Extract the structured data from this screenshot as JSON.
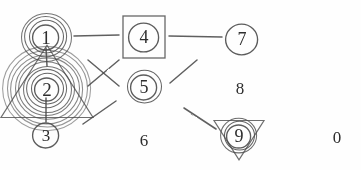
{
  "figure": {
    "background_color": "#fefefe",
    "ink_color": "#4a4a4a",
    "glyph_color": "#2e2e2e",
    "width": 361,
    "height": 170,
    "style": "pencil sketch"
  },
  "nodes": [
    {
      "id": "node-1",
      "label": "1",
      "x": 46,
      "y": 37,
      "font_size": 19,
      "decoration": "concentric-circles",
      "ring_count": 4,
      "ring_radii": [
        13,
        17,
        21,
        25
      ],
      "has_square": false,
      "has_triangle": false
    },
    {
      "id": "node-2",
      "label": "2",
      "x": 47,
      "y": 89,
      "font_size": 19,
      "decoration": "concentric-circles-with-triangle",
      "ring_count": 9,
      "ring_radii": [
        12,
        16,
        20,
        24,
        28,
        32,
        36,
        40,
        44
      ],
      "has_square": false,
      "has_triangle": true,
      "triangle_size": 46,
      "triangle_direction": "up"
    },
    {
      "id": "node-3",
      "label": "3",
      "x": 46,
      "y": 135,
      "font_size": 17,
      "decoration": "single-circle",
      "ring_count": 1,
      "ring_radii": [
        13
      ],
      "has_square": false,
      "has_triangle": false
    },
    {
      "id": "node-4",
      "label": "4",
      "x": 144,
      "y": 37,
      "font_size": 18,
      "decoration": "circle-in-square",
      "ring_count": 1,
      "ring_radii": [
        15
      ],
      "has_square": true,
      "square_size": 42,
      "has_triangle": false
    },
    {
      "id": "node-5",
      "label": "5",
      "x": 144,
      "y": 87,
      "font_size": 18,
      "decoration": "double-circle",
      "ring_count": 2,
      "ring_radii": [
        13,
        17
      ],
      "has_square": false,
      "has_triangle": false
    },
    {
      "id": "node-6",
      "label": "6",
      "x": 144,
      "y": 140,
      "font_size": 17,
      "decoration": "none",
      "ring_count": 0,
      "ring_radii": [],
      "has_square": false,
      "has_triangle": false
    },
    {
      "id": "node-7",
      "label": "7",
      "x": 242,
      "y": 39,
      "font_size": 18,
      "decoration": "single-circle",
      "ring_count": 1,
      "ring_radii": [
        16
      ],
      "has_square": false,
      "has_triangle": false
    },
    {
      "id": "node-8",
      "label": "8",
      "x": 240,
      "y": 88,
      "font_size": 17,
      "decoration": "none",
      "ring_count": 0,
      "ring_radii": [],
      "has_square": false,
      "has_triangle": false
    },
    {
      "id": "node-9",
      "label": "9",
      "x": 239,
      "y": 136,
      "font_size": 18,
      "decoration": "concentric-circles-with-triangle",
      "ring_count": 3,
      "ring_radii": [
        12,
        15,
        18
      ],
      "has_square": false,
      "has_triangle": true,
      "triangle_size": 25,
      "triangle_direction": "down"
    },
    {
      "id": "node-0",
      "label": "0",
      "x": 337,
      "y": 137,
      "font_size": 17,
      "decoration": "none",
      "ring_count": 0,
      "ring_radii": [],
      "has_square": false,
      "has_triangle": false
    }
  ],
  "edges": [
    {
      "id": "edge-1-4",
      "from": "node-1",
      "to": "node-4",
      "x1": 74,
      "y1": 36,
      "x2": 119,
      "y2": 35,
      "kind": "straight-horizontal"
    },
    {
      "id": "edge-4-7",
      "from": "node-4",
      "to": "node-7",
      "x1": 169,
      "y1": 36,
      "x2": 222,
      "y2": 37,
      "kind": "straight-horizontal"
    },
    {
      "id": "edge-1-2",
      "from": "node-1",
      "to": "node-2",
      "x1": 46,
      "y1": 48,
      "x2": 47,
      "y2": 66,
      "kind": "straight-vertical"
    },
    {
      "id": "edge-2-3",
      "from": "node-2",
      "to": "node-3",
      "x1": 46,
      "y1": 98,
      "x2": 46,
      "y2": 122,
      "kind": "straight-vertical"
    },
    {
      "id": "edge-cross-a",
      "from": "cross",
      "to": "cross",
      "x1": 88,
      "y1": 60,
      "x2": 119,
      "y2": 86,
      "kind": "cross-stroke"
    },
    {
      "id": "edge-cross-b",
      "from": "cross",
      "to": "cross",
      "x1": 119,
      "y1": 60,
      "x2": 88,
      "y2": 86,
      "kind": "cross-stroke"
    },
    {
      "id": "edge-5-7",
      "from": "node-5",
      "to": "node-7",
      "x1": 170,
      "y1": 83,
      "x2": 197,
      "y2": 60,
      "kind": "diagonal"
    },
    {
      "id": "edge-5-9",
      "from": "node-5",
      "to": "node-9",
      "x1": 184,
      "y1": 108,
      "x2": 216,
      "y2": 129,
      "kind": "diagonal"
    },
    {
      "id": "edge-2-6",
      "from": "node-2",
      "to": "node-6",
      "x1": 83,
      "y1": 124,
      "x2": 116,
      "y2": 101,
      "kind": "diagonal"
    }
  ]
}
